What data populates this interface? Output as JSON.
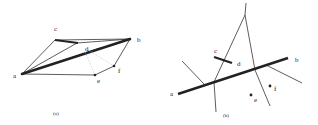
{
  "panel_a": {
    "caption": "(a)",
    "labels": {
      "a": "a",
      "b": "b",
      "c": "c",
      "d": "d",
      "e": "e",
      "f": "f"
    }
  },
  "panel_b": {
    "caption": "(b)",
    "labels": {
      "a": "a",
      "b": "b",
      "c": "c",
      "d": "d",
      "e": "e",
      "f": "f"
    }
  },
  "colors": {
    "stroke": "#222222",
    "thin": "#333333",
    "dotted": "#bbbbbb"
  }
}
